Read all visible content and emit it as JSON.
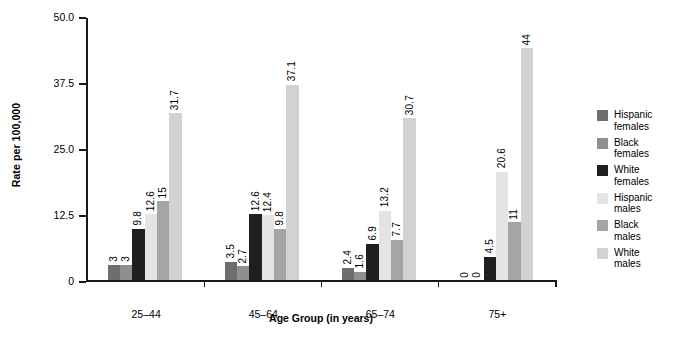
{
  "chart_data": {
    "type": "bar",
    "title": "",
    "xlabel": "Age Group (in years)",
    "ylabel": "Rate per 100,000",
    "categories": [
      "25–44",
      "45–64",
      "65–74",
      "75+"
    ],
    "ylim": [
      0,
      50
    ],
    "yticks": [
      "0",
      "12.5",
      "25.0",
      "37.5",
      "50.0"
    ],
    "ytick_values": [
      0,
      12.5,
      25,
      37.5,
      50
    ],
    "grid": false,
    "legend_position": "right",
    "series": [
      {
        "name": "Hispanic females",
        "color": "#6e6e6e",
        "values": [
          3,
          3.5,
          2.4,
          0
        ],
        "labels": [
          "3",
          "3.5",
          "2.4",
          "0"
        ]
      },
      {
        "name": "Black females",
        "color": "#8f8f8f",
        "values": [
          3,
          2.7,
          1.6,
          0
        ],
        "labels": [
          "3",
          "2.7",
          "1.6",
          "0"
        ]
      },
      {
        "name": "White females",
        "color": "#1f1f1f",
        "values": [
          9.8,
          12.6,
          6.9,
          4.5
        ],
        "labels": [
          "9.8",
          "12.6",
          "6.9",
          "4.5"
        ]
      },
      {
        "name": "Hispanic males",
        "color": "#e4e4e4",
        "values": [
          12.6,
          12.4,
          13.2,
          20.6
        ],
        "labels": [
          "12.6",
          "12.4",
          "13.2",
          "20.6"
        ]
      },
      {
        "name": "Black males",
        "color": "#a5a5a5",
        "values": [
          15,
          9.8,
          7.7,
          11
        ],
        "labels": [
          "15",
          "9.8",
          "7.7",
          "11"
        ]
      },
      {
        "name": "White males",
        "color": "#d2d2d2",
        "values": [
          31.7,
          37.1,
          30.7,
          44
        ],
        "labels": [
          "31.7",
          "37.1",
          "30.7",
          "44"
        ]
      }
    ]
  },
  "legend": {
    "items": [
      {
        "label": "Hispanic\nfemales",
        "color": "#6e6e6e"
      },
      {
        "label": "Black\nfemales",
        "color": "#8f8f8f"
      },
      {
        "label": "White\nfemales",
        "color": "#1f1f1f"
      },
      {
        "label": "Hispanic\nmales",
        "color": "#e4e4e4"
      },
      {
        "label": "Black\nmales",
        "color": "#a5a5a5"
      },
      {
        "label": "White\nmales",
        "color": "#d2d2d2"
      }
    ]
  }
}
